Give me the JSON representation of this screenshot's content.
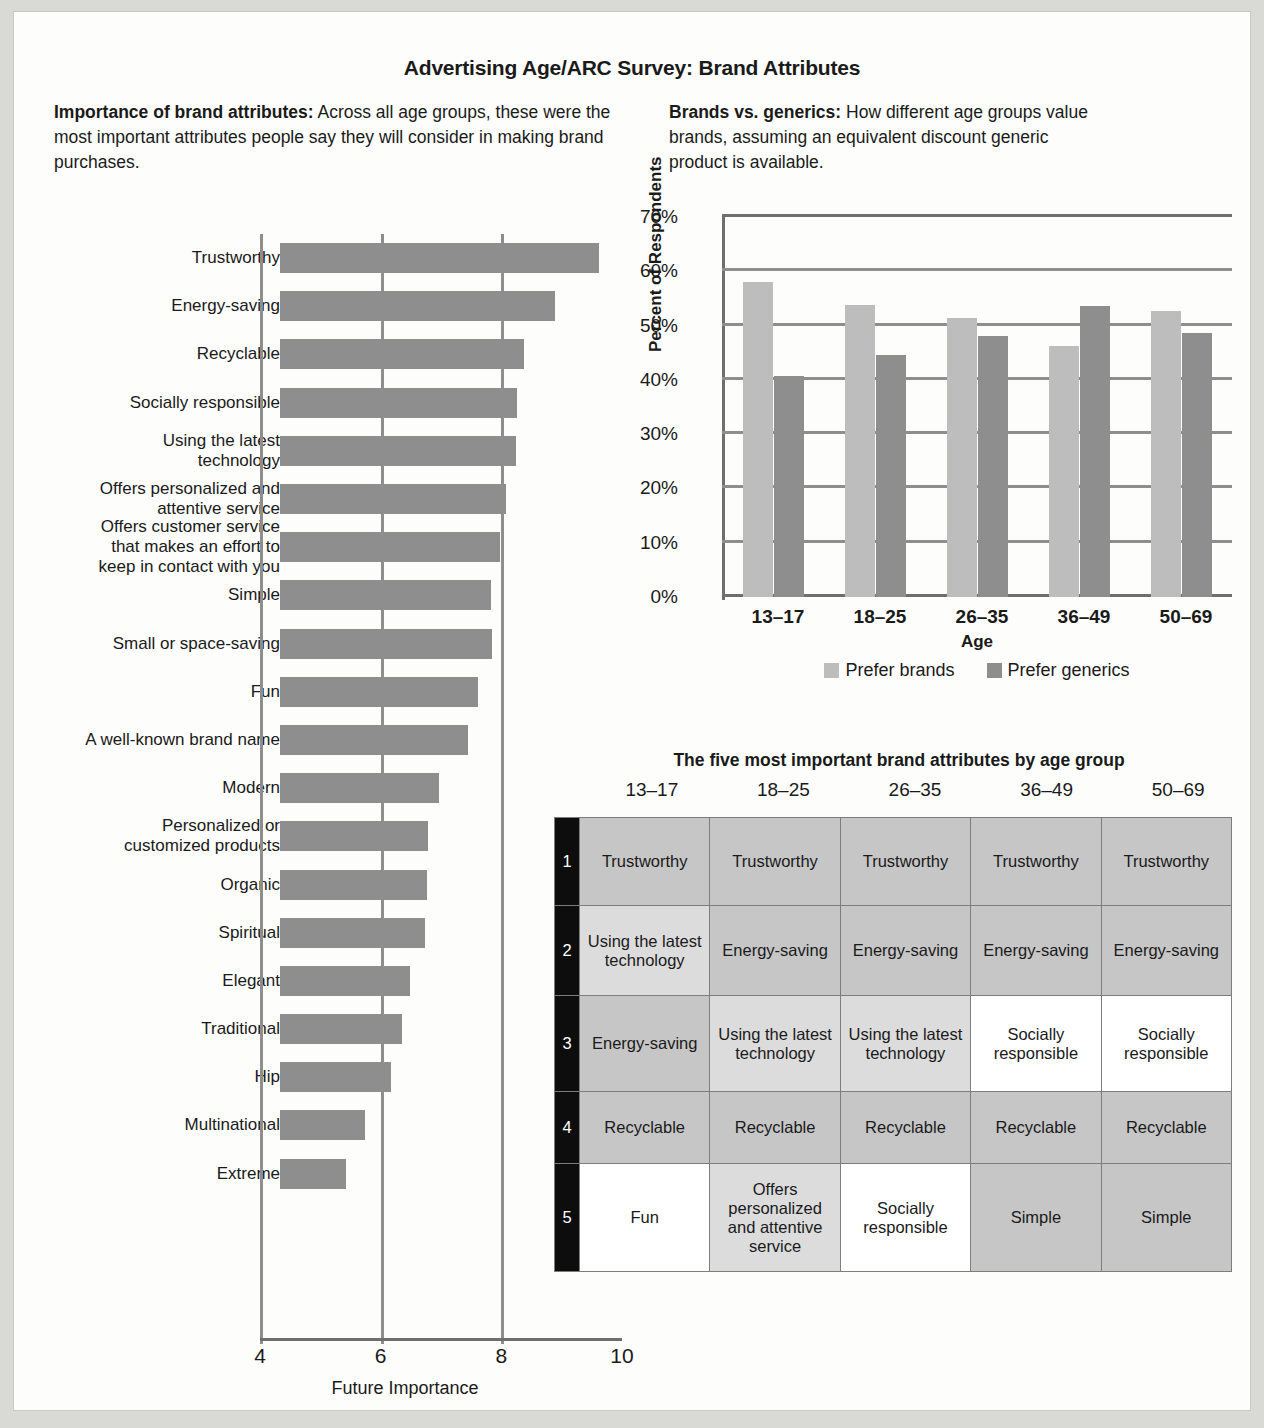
{
  "title": "Advertising Age/ARC Survey: Brand Attributes",
  "left_panel": {
    "heading": "Importance of brand attributes:",
    "body": "Across all age groups, these were the most important attributes people say they will consider in making brand purchases."
  },
  "right_panel": {
    "heading": "Brands vs. generics:",
    "body": " How different age groups value brands, assuming an equivalent discount generic product is available."
  },
  "table_section": {
    "title": "The five most important brand attributes by age group",
    "age_groups": [
      "13–17",
      "18–25",
      "26–35",
      "36–49",
      "50–69"
    ],
    "ranks": [
      "1",
      "2",
      "3",
      "4",
      "5"
    ],
    "rows": [
      {
        "rank": "1",
        "cells": [
          {
            "text": "Trustworthy",
            "shade": "gray"
          },
          {
            "text": "Trustworthy",
            "shade": "gray"
          },
          {
            "text": "Trustworthy",
            "shade": "gray"
          },
          {
            "text": "Trustworthy",
            "shade": "gray"
          },
          {
            "text": "Trustworthy",
            "shade": "gray"
          }
        ]
      },
      {
        "rank": "2",
        "cells": [
          {
            "text": "Using the latest technology",
            "shade": "lgray"
          },
          {
            "text": "Energy-saving",
            "shade": "gray"
          },
          {
            "text": "Energy-saving",
            "shade": "gray"
          },
          {
            "text": "Energy-saving",
            "shade": "gray"
          },
          {
            "text": "Energy-saving",
            "shade": "gray"
          }
        ]
      },
      {
        "rank": "3",
        "cells": [
          {
            "text": "Energy-saving",
            "shade": "gray"
          },
          {
            "text": "Using the latest technology",
            "shade": "lgray"
          },
          {
            "text": "Using the latest technology",
            "shade": "lgray"
          },
          {
            "text": "Socially responsible",
            "shade": "white"
          },
          {
            "text": "Socially responsible",
            "shade": "white"
          }
        ]
      },
      {
        "rank": "4",
        "cells": [
          {
            "text": "Recyclable",
            "shade": "gray"
          },
          {
            "text": "Recyclable",
            "shade": "gray"
          },
          {
            "text": "Recyclable",
            "shade": "gray"
          },
          {
            "text": "Recyclable",
            "shade": "gray"
          },
          {
            "text": "Recyclable",
            "shade": "gray"
          }
        ]
      },
      {
        "rank": "5",
        "cells": [
          {
            "text": "Fun",
            "shade": "white"
          },
          {
            "text": "Offers personalized and attentive service",
            "shade": "lgray"
          },
          {
            "text": "Socially responsible",
            "shade": "white"
          },
          {
            "text": "Simple",
            "shade": "gray"
          },
          {
            "text": "Simple",
            "shade": "gray"
          }
        ]
      }
    ]
  },
  "colors": {
    "bar_gray": "#8e8e8e",
    "brands_light": "#bdbdbd",
    "generics_dark": "#8e8e8e",
    "rank_black": "#0d0d0d",
    "page_bg": "#fdfdfb",
    "outer_bg": "#d9d9d6"
  },
  "chart_data": [
    {
      "type": "bar",
      "orientation": "horizontal",
      "title": "Importance of brand attributes",
      "xlabel": "Future Importance",
      "ylabel": "",
      "xlim": [
        4,
        10
      ],
      "xticks": [
        4,
        6,
        8,
        10
      ],
      "grid": true,
      "categories": [
        "Trustworthy",
        "Energy-saving",
        "Recyclable",
        "Socially responsible",
        "Using the latest technology",
        "Offers personalized and attentive service",
        "Offers customer service that makes an effort to keep in contact with you",
        "Simple",
        "Small or space-saving",
        "Fun",
        "A well-known brand name",
        "Modern",
        "Personalized or customized products",
        "Organic",
        "Spiritual",
        "Elegant",
        "Traditional",
        "Hip",
        "Multinational",
        "Extreme"
      ],
      "category_lines": [
        [
          "Trustworthy"
        ],
        [
          "Energy-saving"
        ],
        [
          "Recyclable"
        ],
        [
          "Socially responsible"
        ],
        [
          "Using the latest",
          "technology"
        ],
        [
          "Offers personalized and",
          "attentive service"
        ],
        [
          "Offers customer service",
          "that makes an effort to",
          "keep in contact with you"
        ],
        [
          "Simple"
        ],
        [
          "Small or space-saving"
        ],
        [
          "Fun"
        ],
        [
          "A well-known brand name"
        ],
        [
          "Modern"
        ],
        [
          "Personalized or",
          "customized products"
        ],
        [
          "Organic"
        ],
        [
          "Spiritual"
        ],
        [
          "Elegant"
        ],
        [
          "Traditional"
        ],
        [
          "Hip"
        ],
        [
          "Multinational"
        ],
        [
          "Extreme"
        ]
      ],
      "values": [
        9.28,
        8.55,
        8.05,
        7.93,
        7.91,
        7.74,
        7.64,
        7.5,
        7.52,
        7.29,
        7.12,
        6.64,
        6.45,
        6.43,
        6.41,
        6.16,
        6.02,
        5.84,
        5.41,
        5.09
      ]
    },
    {
      "type": "bar",
      "orientation": "vertical",
      "title": "Brands vs. generics",
      "xlabel": "Age",
      "ylabel": "Percent of Respondents",
      "ylim": [
        0,
        70
      ],
      "yticks": [
        0,
        10,
        20,
        30,
        40,
        50,
        60,
        70
      ],
      "ytick_labels": [
        "0%",
        "10%",
        "20%",
        "30%",
        "40%",
        "50%",
        "60%",
        "70%"
      ],
      "categories": [
        "13–17",
        "18–25",
        "26–35",
        "36–49",
        "50–69"
      ],
      "grid": true,
      "legend_position": "bottom",
      "series": [
        {
          "name": "Prefer brands",
          "color": "#bdbdbd",
          "values": [
            58.1,
            53.8,
            51.4,
            46.2,
            52.6
          ]
        },
        {
          "name": "Prefer generics",
          "color": "#8e8e8e",
          "values": [
            40.7,
            44.5,
            48.1,
            53.7,
            48.7
          ]
        }
      ]
    }
  ]
}
